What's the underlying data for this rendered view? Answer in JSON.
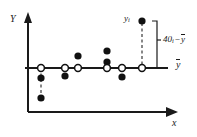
{
  "figure": {
    "type": "scatter-deviation-diagram",
    "background_color": "#ffffff",
    "ink_color": "#1a1a1a",
    "axes": {
      "y_axis_label": "Y",
      "x_axis_label": "x",
      "y_axis": {
        "x": 28,
        "y_top": 14,
        "y_bottom": 112
      },
      "x_axis": {
        "y": 112,
        "x_left": 28,
        "x_right": 178
      }
    },
    "mean_line": {
      "label": "ȳ",
      "label_text_y": "y",
      "y": 68,
      "x_start": 25,
      "x_end": 168,
      "label_x": 176,
      "label_y": 62
    },
    "open_points_on_mean_line": [
      {
        "x": 41,
        "y": 68
      },
      {
        "x": 65,
        "y": 68
      },
      {
        "x": 78,
        "y": 68
      },
      {
        "x": 107,
        "y": 68
      },
      {
        "x": 122,
        "y": 68
      },
      {
        "x": 142,
        "y": 68
      }
    ],
    "filled_points": [
      {
        "x": 41,
        "y": 78
      },
      {
        "x": 41,
        "y": 98
      },
      {
        "x": 65,
        "y": 76
      },
      {
        "x": 78,
        "y": 56
      },
      {
        "x": 107,
        "y": 51
      },
      {
        "x": 107,
        "y": 62
      },
      {
        "x": 122,
        "y": 77
      },
      {
        "x": 142,
        "y": 21
      }
    ],
    "dashed_connectors": [
      {
        "x": 41,
        "y_from": 68,
        "y_to": 98
      },
      {
        "x": 142,
        "y_from": 21,
        "y_to": 68
      }
    ],
    "highlight_point": {
      "label": "y",
      "label_sub": "i",
      "x": 142,
      "y": 21,
      "label_x": 124,
      "label_y": 15
    },
    "brace": {
      "label_y": 40,
      "label_sub": "i",
      "label_minus": "−",
      "label_mean": "y",
      "x": 157,
      "y_top": 21,
      "y_bottom": 68,
      "label_x": 163
    }
  }
}
